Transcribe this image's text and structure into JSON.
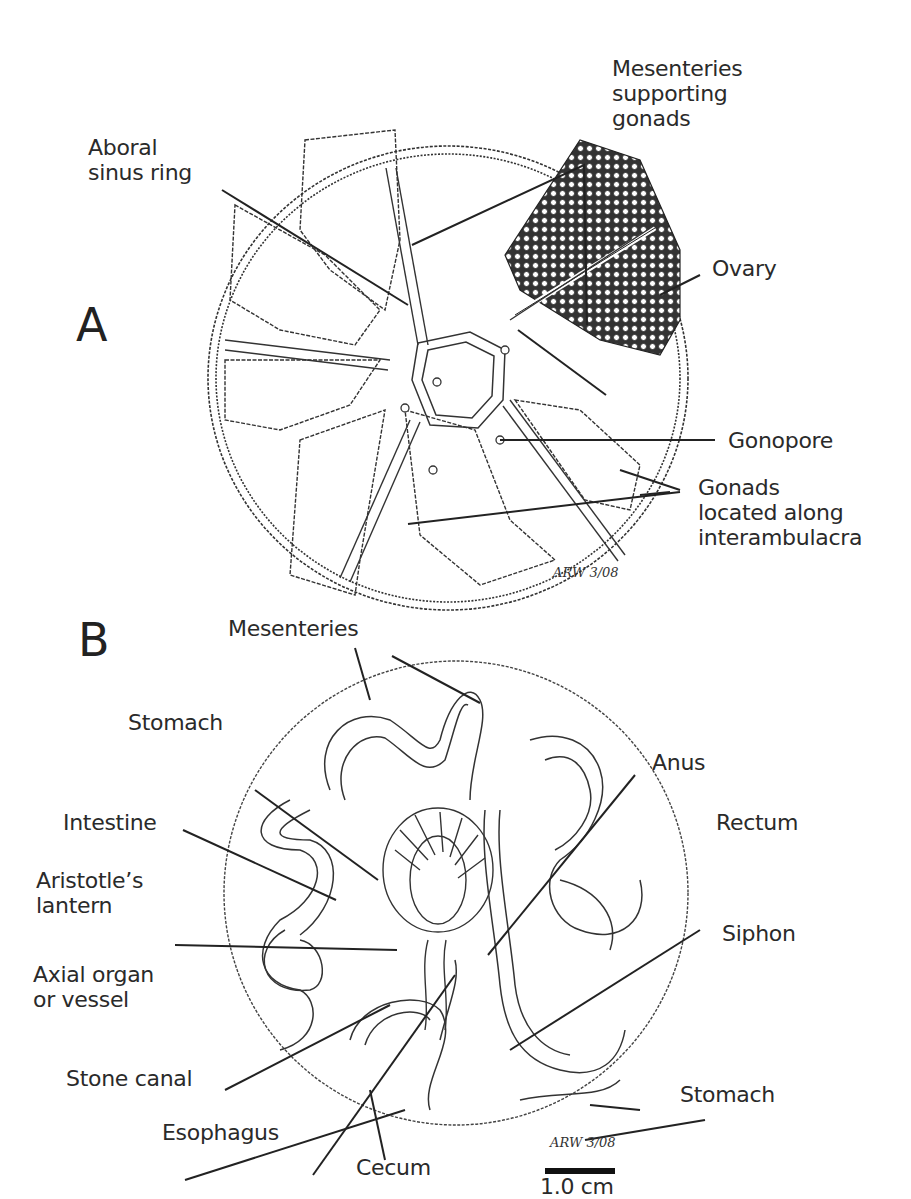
{
  "panel_a": {
    "letter": "A",
    "labels": {
      "mesenteries_supporting_gonads": "Mesenteries\nsupporting\ngonads",
      "aboral_sinus_ring": "Aboral\nsinus ring",
      "ovary": "Ovary",
      "gonopore": "Gonopore",
      "gonads_interambulacra": "Gonads\nlocated along\ninterambulacra"
    },
    "signature": "ARW 3/08"
  },
  "panel_b": {
    "letter": "B",
    "labels": {
      "mesenteries": "Mesenteries",
      "stomach_top": "Stomach",
      "anus": "Anus",
      "intestine": "Intestine",
      "rectum": "Rectum",
      "aristotles_lantern": "Aristotle’s\nlantern",
      "siphon": "Siphon",
      "axial_organ": "Axial organ\nor vessel",
      "stomach_bottom": "Stomach",
      "stone_canal": "Stone canal",
      "esophagus": "Esophagus",
      "cecum": "Cecum"
    },
    "signature": "ARW 3/08",
    "scale_bar": "1.0 cm"
  }
}
